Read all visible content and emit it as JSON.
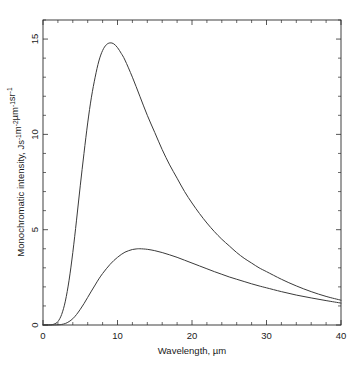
{
  "chart_data": {
    "type": "line",
    "title": "",
    "xlabel": "Wavelength, µm",
    "ylabel_main": "Monochromatic intensity, ",
    "ylabel_units": "Js⁻¹m⁻²µm⁻¹sr⁻¹",
    "ylabel": "Monochromatic intensity, Js⁻¹m⁻²µm⁻¹sr⁻¹",
    "xlim": [
      0,
      40
    ],
    "ylim": [
      0,
      16
    ],
    "x_major_ticks": [
      0,
      10,
      20,
      30,
      40
    ],
    "x_major_tick_labels": [
      "0",
      "10",
      "20",
      "30",
      "40"
    ],
    "x_minor_tick_step": 2,
    "y_major_ticks": [
      0,
      5,
      10,
      15
    ],
    "y_major_tick_labels": [
      "0",
      "5",
      "10",
      "15"
    ],
    "y_minor_tick_step": 1,
    "grid": false,
    "legend": "none",
    "series": [
      {
        "name": "upper-curve",
        "peak_x": 9.0,
        "peak_y": 14.8,
        "x": [
          0,
          1,
          1.5,
          2,
          2.5,
          3,
          3.5,
          4,
          4.5,
          5,
          5.5,
          6,
          6.5,
          7,
          7.5,
          8,
          8.5,
          9,
          9.5,
          10,
          10.5,
          11,
          12,
          13,
          14,
          15,
          16,
          17,
          18,
          19,
          20,
          21,
          22,
          23,
          24,
          25,
          26,
          27,
          28,
          29,
          30,
          32,
          34,
          36,
          38,
          40
        ],
        "values": [
          0,
          0.01,
          0.05,
          0.18,
          0.55,
          1.25,
          2.35,
          3.8,
          5.5,
          7.3,
          9.0,
          10.6,
          11.95,
          13.0,
          13.85,
          14.4,
          14.7,
          14.8,
          14.75,
          14.55,
          14.25,
          13.9,
          13.0,
          12.0,
          11.0,
          10.1,
          9.2,
          8.4,
          7.7,
          7.0,
          6.4,
          5.85,
          5.35,
          4.9,
          4.5,
          4.15,
          3.8,
          3.5,
          3.25,
          3.0,
          2.8,
          2.4,
          2.05,
          1.75,
          1.5,
          1.3
        ]
      },
      {
        "name": "lower-curve",
        "peak_x": 11.8,
        "peak_y": 4.0,
        "x": [
          0,
          1,
          2,
          2.5,
          3,
          3.5,
          4,
          4.5,
          5,
          5.5,
          6,
          6.5,
          7,
          7.5,
          8,
          8.5,
          9,
          9.5,
          10,
          10.5,
          11,
          11.5,
          12,
          12.5,
          13,
          14,
          15,
          16,
          17,
          18,
          19,
          20,
          21,
          22,
          23,
          24,
          25,
          26,
          27,
          28,
          29,
          30,
          32,
          34,
          36,
          38,
          40
        ],
        "values": [
          0,
          0,
          0.01,
          0.03,
          0.08,
          0.18,
          0.33,
          0.55,
          0.82,
          1.12,
          1.45,
          1.78,
          2.1,
          2.42,
          2.7,
          2.95,
          3.18,
          3.38,
          3.55,
          3.7,
          3.82,
          3.9,
          3.96,
          3.99,
          4.0,
          3.97,
          3.9,
          3.8,
          3.68,
          3.55,
          3.4,
          3.25,
          3.1,
          2.95,
          2.8,
          2.66,
          2.52,
          2.4,
          2.28,
          2.16,
          2.05,
          1.95,
          1.75,
          1.57,
          1.42,
          1.28,
          1.15
        ]
      }
    ]
  }
}
